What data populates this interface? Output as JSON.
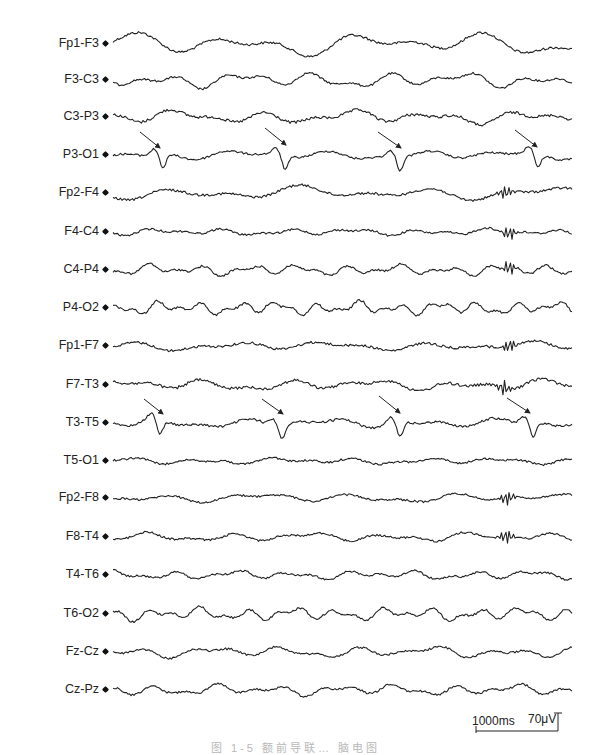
{
  "figure": {
    "type": "EEG recording (bipolar montage)",
    "channels": [
      {
        "label": "Fp1-F3",
        "y": 44,
        "amp": 10,
        "freq": 1.0,
        "noise": 1.2
      },
      {
        "label": "F3-C3",
        "y": 80,
        "amp": 7,
        "freq": 1.6,
        "noise": 1.0
      },
      {
        "label": "C3-P3",
        "y": 117,
        "amp": 6,
        "freq": 1.4,
        "noise": 1.4
      },
      {
        "label": "P3-O1",
        "y": 155,
        "amp": 4,
        "freq": 1.3,
        "noise": 1.0,
        "spikes": [
          163,
          285,
          400,
          538
        ]
      },
      {
        "label": "Fp2-F4",
        "y": 193,
        "amp": 6,
        "freq": 1.0,
        "noise": 1.2,
        "burst": 505
      },
      {
        "label": "F4-C4",
        "y": 232,
        "amp": 3,
        "freq": 1.8,
        "noise": 1.0,
        "burst": 509
      },
      {
        "label": "C4-P4",
        "y": 270,
        "amp": 5,
        "freq": 2.4,
        "noise": 1.0,
        "burst": 509
      },
      {
        "label": "P4-O2",
        "y": 308,
        "amp": 6,
        "freq": 3.0,
        "noise": 1.0
      },
      {
        "label": "Fp1-F7",
        "y": 346,
        "amp": 4,
        "freq": 1.2,
        "noise": 1.2,
        "burst": 509
      },
      {
        "label": "F7-T3",
        "y": 385,
        "amp": 5,
        "freq": 1.4,
        "noise": 1.4,
        "burst": 505
      },
      {
        "label": "T3-T5",
        "y": 423,
        "amp": 4,
        "freq": 1.4,
        "noise": 1.2,
        "spikes": [
          160,
          282,
          400,
          533
        ]
      },
      {
        "label": "T5-O1",
        "y": 461,
        "amp": 3,
        "freq": 1.6,
        "noise": 1.0
      },
      {
        "label": "Fp2-F8",
        "y": 498,
        "amp": 4,
        "freq": 1.2,
        "noise": 1.0,
        "burst": 507
      },
      {
        "label": "F8-T4",
        "y": 537,
        "amp": 4,
        "freq": 1.5,
        "noise": 1.0,
        "burst": 507
      },
      {
        "label": "T4-T6",
        "y": 575,
        "amp": 4,
        "freq": 2.0,
        "noise": 1.0
      },
      {
        "label": "T6-O2",
        "y": 614,
        "amp": 6,
        "freq": 2.6,
        "noise": 1.0
      },
      {
        "label": "Fz-Cz",
        "y": 652,
        "amp": 5,
        "freq": 1.6,
        "noise": 1.0
      },
      {
        "label": "Cz-Pz",
        "y": 690,
        "amp": 5,
        "freq": 2.0,
        "noise": 1.0
      }
    ],
    "arrows": [
      {
        "row": "P3-O1",
        "x1": 140,
        "y1": 132,
        "x2": 160,
        "y2": 148
      },
      {
        "row": "P3-O1",
        "x1": 265,
        "y1": 128,
        "x2": 286,
        "y2": 145
      },
      {
        "row": "P3-O1",
        "x1": 378,
        "y1": 132,
        "x2": 401,
        "y2": 148
      },
      {
        "row": "P3-O1",
        "x1": 515,
        "y1": 130,
        "x2": 537,
        "y2": 147
      },
      {
        "row": "T3-T5",
        "x1": 144,
        "y1": 399,
        "x2": 163,
        "y2": 414
      },
      {
        "row": "T3-T5",
        "x1": 262,
        "y1": 399,
        "x2": 283,
        "y2": 414
      },
      {
        "row": "T3-T5",
        "x1": 379,
        "y1": 396,
        "x2": 400,
        "y2": 413
      },
      {
        "row": "T3-T5",
        "x1": 507,
        "y1": 398,
        "x2": 530,
        "y2": 413
      }
    ],
    "scale_bar": {
      "time_label": "1000ms",
      "amplitude_label": "70μV"
    },
    "caption": "图 1-5  额前导联… 脑电图"
  }
}
